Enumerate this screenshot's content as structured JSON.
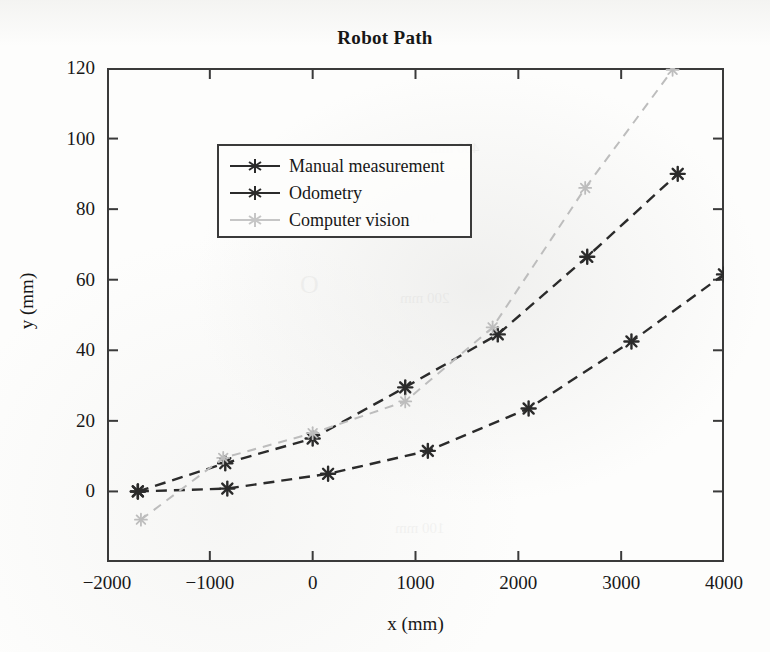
{
  "figure": {
    "title": "Robot Path",
    "background_color": "#fdfdfc",
    "frame_color": "#3a3a3a"
  },
  "axes": {
    "x_title": "x (mm)",
    "y_title": "y (mm)",
    "x_ticks": [
      "-2000",
      "-1000",
      "0",
      "1000",
      "2000",
      "3000",
      "4000"
    ],
    "y_ticks": [
      "0",
      "20",
      "40",
      "60",
      "80",
      "100",
      "120"
    ]
  },
  "legend": {
    "position": "top-left",
    "entries": [
      {
        "label": "Manual measurement",
        "color": "#2b2b2b"
      },
      {
        "label": "Odometry",
        "color": "#2b2b2b"
      },
      {
        "label": "Computer vision",
        "color": "#bdbdbd"
      }
    ]
  },
  "chart_data": {
    "type": "line",
    "title": "Robot Path",
    "xlabel": "x (mm)",
    "ylabel": "y (mm)",
    "xlim": [
      -2000,
      4000
    ],
    "ylim": [
      -20,
      120
    ],
    "xticks": [
      -2000,
      -1000,
      0,
      1000,
      2000,
      3000,
      4000
    ],
    "yticks": [
      0,
      20,
      40,
      60,
      80,
      100,
      120
    ],
    "grid": false,
    "legend_position": "upper left",
    "marker": "star",
    "linestyle": "dashed",
    "series": [
      {
        "name": "Manual measurement",
        "color": "#2b2b2b",
        "x": [
          -1700,
          -850,
          0,
          900,
          1800,
          2670,
          3550
        ],
        "y": [
          0,
          8,
          15,
          29.5,
          44.5,
          66.5,
          90
        ]
      },
      {
        "name": "Odometry",
        "color": "#2b2b2b",
        "x": [
          -1700,
          -830,
          150,
          1120,
          2100,
          3100,
          4000
        ],
        "y": [
          0,
          0.8,
          5,
          11.5,
          23.5,
          42.5,
          61.5
        ]
      },
      {
        "name": "Computer vision",
        "color": "#bdbdbd",
        "x": [
          -1670,
          -870,
          0,
          900,
          1750,
          2650,
          3500
        ],
        "y": [
          -8,
          9.5,
          16.5,
          25.5,
          46.5,
          86,
          119.5
        ]
      }
    ]
  }
}
